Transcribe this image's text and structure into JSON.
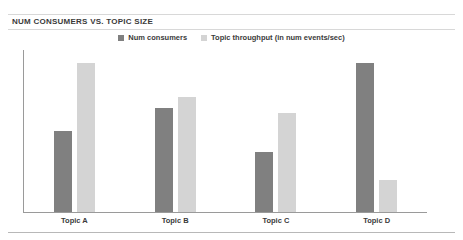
{
  "chart_data": {
    "type": "bar",
    "title": "NUM CONSUMERS VS. TOPIC SIZE",
    "xlabel": "",
    "ylabel": "",
    "grid": false,
    "legend_position": "top-center",
    "categories": [
      "Topic A",
      "Topic B",
      "Topic C",
      "Topic D"
    ],
    "ylim": [
      0,
      100
    ],
    "series": [
      {
        "name": "Num consumers",
        "color": "#808080",
        "values": [
          50,
          64,
          37,
          92
        ]
      },
      {
        "name": "Topic throughput (in num events/sec)",
        "color": "#d4d4d4",
        "values": [
          92,
          71,
          61,
          20
        ]
      }
    ]
  },
  "colors": {
    "series_dark": "#808080",
    "series_light": "#d4d4d4",
    "axis": "#9a9a9a",
    "rule": "#d8d8d8",
    "text": "#3a3a3a"
  }
}
